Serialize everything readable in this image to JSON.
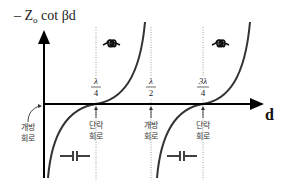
{
  "diagram": {
    "y_axis_label": "– Z",
    "y_axis_label_sub": "o",
    "y_axis_label_rest": " cot βd",
    "x_axis_label": "d",
    "ticks": [
      {
        "num": "λ",
        "den": "4",
        "value": 0.25
      },
      {
        "num": "λ",
        "den": "2",
        "value": 0.5
      },
      {
        "num": "3λ",
        "den": "4",
        "value": 0.75
      }
    ],
    "annotations": {
      "open_circuit_1": [
        "개방",
        "회로"
      ],
      "short_circuit_1": [
        "단락",
        "회로"
      ],
      "open_circuit_2": [
        "개방",
        "회로"
      ],
      "short_circuit_2": [
        "단락",
        "회로"
      ]
    },
    "symbols": {
      "inductor": "inductor-symbol",
      "capacitor": "capacitor-symbol"
    },
    "colors": {
      "axis": "#000000",
      "curve": "#333333",
      "dotted": "#888888",
      "text": "#222222"
    }
  }
}
